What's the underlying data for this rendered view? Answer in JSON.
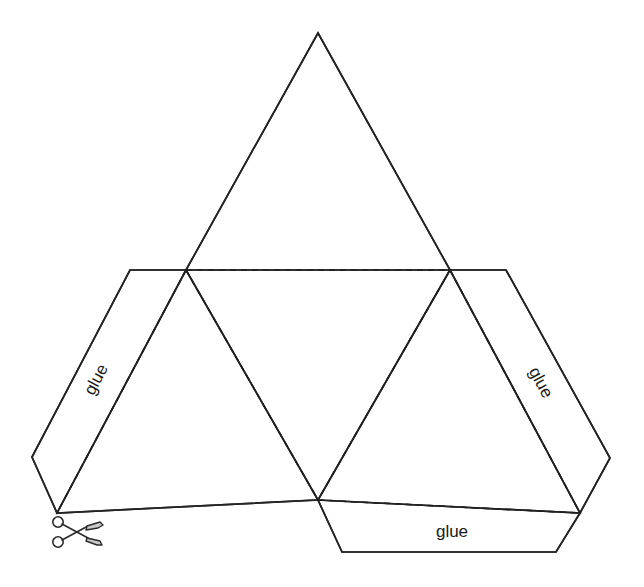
{
  "document": {
    "title": "Tetrahedron net cut-out template",
    "background_color": "#ffffff"
  },
  "colors": {
    "face_top": "#cfcfcf",
    "face_center": "#939393",
    "face_left": "#b8b8b8",
    "face_right": "#cacaca",
    "flap_left": "#b4b4b4",
    "flap_right": "#c6c6c6",
    "flap_bottom": "#c9c9c9",
    "edge_solid": "#242424",
    "edge_fold": "#1f1f1f",
    "digit": "#ffffff",
    "label_text": "#1a1a1a"
  },
  "faces": [
    {
      "id": "face-top",
      "name": "top-triangle",
      "fill": "#cfcfcf",
      "points": "318,33 186,270 450,270",
      "digits": [
        {
          "value": "1",
          "x": 318,
          "y": 95,
          "rotate": 0
        },
        {
          "value": "1",
          "x": 235,
          "y": 245,
          "rotate": 120
        },
        {
          "value": "1",
          "x": 401,
          "y": 245,
          "rotate": -120
        }
      ]
    },
    {
      "id": "face-center",
      "name": "center-triangle",
      "fill": "#939393",
      "points": "186,270 450,270 318,500",
      "digits": [
        {
          "value": "1",
          "x": 232,
          "y": 297,
          "rotate": 60
        },
        {
          "value": "1",
          "x": 404,
          "y": 297,
          "rotate": -60
        },
        {
          "value": "2",
          "x": 318,
          "y": 455,
          "rotate": 180
        }
      ]
    },
    {
      "id": "face-left",
      "name": "left-triangle",
      "fill": "#b8b8b8",
      "points": "186,270 318,500 57,513",
      "digits": [
        {
          "value": "1",
          "x": 190,
          "y": 333,
          "rotate": 0
        },
        {
          "value": "1",
          "x": 100,
          "y": 482,
          "rotate": 120
        },
        {
          "value": "2",
          "x": 263,
          "y": 471,
          "rotate": 210
        }
      ]
    },
    {
      "id": "face-right",
      "name": "right-triangle",
      "fill": "#cacaca",
      "points": "450,270 318,500 580,513",
      "digits": [
        {
          "value": "1",
          "x": 452,
          "y": 330,
          "rotate": 0
        },
        {
          "value": "1",
          "x": 534,
          "y": 480,
          "rotate": -120
        },
        {
          "value": "2",
          "x": 374,
          "y": 473,
          "rotate": 150
        }
      ]
    }
  ],
  "flaps": [
    {
      "id": "flap-left",
      "name": "left-glue-flap",
      "fill": "#b4b4b4",
      "points": "186,270 130,270 32,457 57,513",
      "label": "glue",
      "label_x": 97,
      "label_y": 380,
      "label_rotate": -62
    },
    {
      "id": "flap-right",
      "name": "right-glue-flap",
      "fill": "#c6c6c6",
      "points": "450,270 506,270 610,458 580,513",
      "label": "glue",
      "label_x": 540,
      "label_y": 383,
      "label_rotate": 62
    },
    {
      "id": "flap-bottom",
      "name": "bottom-glue-flap",
      "fill": "#c9c9c9",
      "points": "318,500 580,513 556,552 342,552",
      "label": "glue",
      "label_x": 452,
      "label_y": 533,
      "label_rotate": 0
    }
  ],
  "fold_edges": [
    {
      "name": "fold-top-base",
      "d": "M 186,270 L 450,270"
    },
    {
      "name": "fold-center-left",
      "d": "M 186,270 L 318,500"
    },
    {
      "name": "fold-center-right",
      "d": "M 450,270 L 318,500"
    },
    {
      "name": "fold-left-flap",
      "d": "M 186,270 L 57,513"
    },
    {
      "name": "fold-right-flap",
      "d": "M 450,270 L 580,513"
    },
    {
      "name": "fold-bottom-flap",
      "d": "M 318,500 L 580,513"
    }
  ],
  "outline": {
    "name": "net-outline",
    "d": "M 318,33 L 450,270 L 506,270 L 610,458 L 580,513 L 556,552 L 342,552 L 318,500 L 57,513 L 32,457 L 130,270 L 186,270 Z"
  },
  "icons": [
    {
      "name": "scissors-icon",
      "glyph": "scissors",
      "x": 78,
      "y": 534,
      "meaning": "cut along this line"
    }
  ],
  "legend": {
    "solid_line_meaning": "cut line",
    "dashed_line_meaning": "fold line",
    "digit_values": [
      "1",
      "2"
    ],
    "flap_label": "glue"
  }
}
